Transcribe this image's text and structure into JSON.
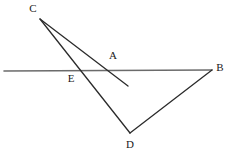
{
  "figure": {
    "background_color": "#ffffff",
    "stroke_color": "#2b2b2b",
    "transversal_color": "#6b6b6b",
    "width": 236,
    "height": 157,
    "points": {
      "C": {
        "label": "C",
        "x": 40,
        "y": 19,
        "label_x": 33,
        "label_y": 9
      },
      "A": {
        "label": "A",
        "x": 110,
        "y": 71,
        "label_x": 113,
        "label_y": 56
      },
      "B": {
        "label": "B",
        "x": 212,
        "y": 70,
        "label_x": 220,
        "label_y": 68
      },
      "D": {
        "label": "D",
        "x": 130,
        "y": 133,
        "label_x": 130,
        "label_y": 145
      },
      "E": {
        "label": "E",
        "x": 78,
        "y": 71,
        "label_x": 71,
        "label_y": 79
      }
    },
    "segments": [
      {
        "name": "transversal-line-HB",
        "from_x": 4,
        "from_y": 71,
        "to_x": 212,
        "to_y": 70,
        "color": "#6b6b6b",
        "width": 1.6
      },
      {
        "name": "ray-C-through-A",
        "from_x": 40,
        "from_y": 19,
        "to_x": 128,
        "to_y": 86,
        "color": "#2b2b2b",
        "width": 1.3
      },
      {
        "name": "segment-C-through-E-to-D",
        "from_x": 40,
        "from_y": 19,
        "to_x": 130,
        "to_y": 133,
        "color": "#2b2b2b",
        "width": 1.3
      },
      {
        "name": "segment-D-to-B",
        "from_x": 130,
        "from_y": 133,
        "to_x": 212,
        "to_y": 70,
        "color": "#2b2b2b",
        "width": 1.3
      }
    ]
  }
}
